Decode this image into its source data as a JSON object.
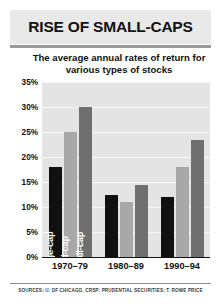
{
  "chart_data": {
    "type": "bar",
    "title": "RISE OF SMALL-CAPS",
    "subtitle": "The average annual rates of return for various types of stocks",
    "xlabel": "",
    "ylabel": "",
    "ylim": [
      0,
      35
    ],
    "ytick_step": 5,
    "ytick_labels": [
      "0%",
      "5%",
      "10%",
      "15%",
      "20%",
      "25%",
      "30%",
      "35%"
    ],
    "ytick_values": [
      0,
      5,
      10,
      15,
      20,
      25,
      30,
      35
    ],
    "grid": true,
    "legend_position": "in-bar-vertical-labels",
    "categories": [
      "1970–79",
      "1980–89",
      "1990–94"
    ],
    "series": [
      {
        "name": "Large-cap",
        "color": "#101010",
        "values": [
          18.0,
          12.5,
          12.0
        ]
      },
      {
        "name": "Mid-cap",
        "color": "#a8a8a8",
        "values": [
          25.0,
          11.0,
          18.0
        ]
      },
      {
        "name": "Small-cap",
        "color": "#6f6f6f",
        "values": [
          30.0,
          14.5,
          23.5
        ]
      }
    ],
    "annotations": [
      "Large-cap",
      "Mid-cap",
      "Small-cap"
    ],
    "source": "SOURCES: U. OF CHICAGO, CRSP; PRUDENTIAL SECURITIES; T. ROWE PRICE"
  }
}
